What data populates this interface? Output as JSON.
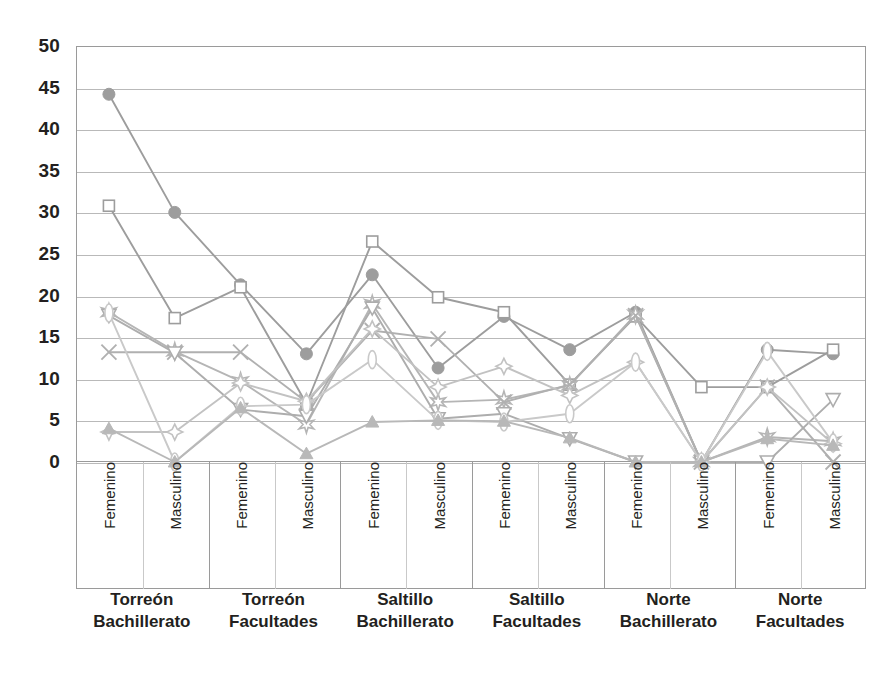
{
  "chart_data": {
    "type": "line",
    "title": "",
    "xlabel": "",
    "ylabel": "",
    "ylim": [
      0,
      50
    ],
    "ytick_step": 5,
    "yticks": [
      "50",
      "45",
      "40",
      "35",
      "30",
      "25",
      "20",
      "15",
      "10",
      "5",
      "0"
    ],
    "grid": true,
    "legend": "none",
    "x_sub_labels": [
      "Femenino",
      "Masculino"
    ],
    "groups": [
      {
        "line1": "Torreón",
        "line2": "Bachillerato"
      },
      {
        "line1": "Torreón",
        "line2": "Facultades"
      },
      {
        "line1": "Saltillo",
        "line2": "Bachillerato"
      },
      {
        "line1": "Saltillo",
        "line2": "Facultades"
      },
      {
        "line1": "Norte",
        "line2": "Bachillerato"
      },
      {
        "line1": "Norte",
        "line2": "Facultades"
      }
    ],
    "categories": [
      "Torreón Bachillerato Femenino",
      "Torreón Bachillerato Masculino",
      "Torreón Facultades Femenino",
      "Torreón Facultades Masculino",
      "Saltillo Bachillerato Femenino",
      "Saltillo Bachillerato Masculino",
      "Saltillo Facultades Femenino",
      "Saltillo Facultades Masculino",
      "Norte Bachillerato Femenino",
      "Norte Bachillerato Masculino",
      "Norte Facultades Femenino",
      "Norte Facultades Masculino"
    ],
    "series": [
      {
        "name": "serie-circulo",
        "marker": "filled-circle",
        "color": "#9d9d9d",
        "values": [
          44.2,
          30.0,
          21.3,
          13.0,
          22.5,
          11.3,
          17.5,
          13.5,
          18.0,
          0.0,
          13.5,
          13.0
        ]
      },
      {
        "name": "serie-cuadrado",
        "marker": "open-square",
        "color": "#9d9d9d",
        "values": [
          30.8,
          17.3,
          21.0,
          7.0,
          26.5,
          19.8,
          18.0,
          9.3,
          17.5,
          9.0,
          9.0,
          13.5
        ]
      },
      {
        "name": "serie-estrella",
        "marker": "starburst",
        "color": "#b5b5b5",
        "values": [
          18.0,
          13.3,
          9.7,
          4.5,
          19.0,
          7.2,
          7.5,
          9.2,
          17.7,
          0.0,
          3.0,
          2.5
        ]
      },
      {
        "name": "serie-equis",
        "marker": "cross-x",
        "color": "#b0b0b0",
        "values": [
          13.2,
          13.2,
          13.2,
          7.2,
          15.8,
          14.8,
          7.2,
          9.3,
          17.6,
          0.0,
          9.0,
          0.0
        ]
      },
      {
        "name": "serie-triangulo-abajo",
        "marker": "open-triangle-down",
        "color": "#adadad",
        "values": [
          17.6,
          13.1,
          6.3,
          5.5,
          18.5,
          5.2,
          5.8,
          2.8,
          0.0,
          0.0,
          0.0,
          7.5
        ]
      },
      {
        "name": "serie-rombo",
        "marker": "four-point-diamond",
        "color": "#c2c2c2",
        "values": [
          3.6,
          3.6,
          9.5,
          7.3,
          16.0,
          9.0,
          11.5,
          8.0,
          12.0,
          0.0,
          9.0,
          2.2
        ]
      },
      {
        "name": "serie-elipse",
        "marker": "open-ellipse",
        "color": "#c9c9c9",
        "values": [
          17.9,
          0.0,
          6.7,
          6.9,
          12.3,
          5.0,
          4.8,
          5.8,
          12.0,
          0.0,
          13.3,
          2.3
        ]
      },
      {
        "name": "serie-triangulo-lleno",
        "marker": "filled-triangle",
        "color": "#b8b8b8",
        "values": [
          4.0,
          0.0,
          6.5,
          1.0,
          4.8,
          5.0,
          4.9,
          2.9,
          0.0,
          0.0,
          2.8,
          2.0
        ]
      }
    ]
  }
}
